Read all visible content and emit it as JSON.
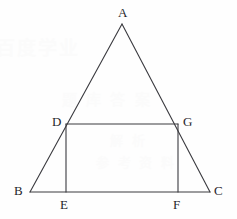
{
  "figure": {
    "kind": "geometry-diagram",
    "canvas": {
      "width": 237,
      "height": 219
    },
    "background_color": "#fefefe",
    "stroke_color": "#3a3a3f",
    "label_color": "#26262b",
    "stroke_width": 1.1,
    "points": {
      "A": {
        "label": "A",
        "x": 122,
        "y": 24,
        "label_x": 118,
        "label_y": 6
      },
      "B": {
        "label": "B",
        "x": 30,
        "y": 192,
        "label_x": 14,
        "label_y": 184
      },
      "C": {
        "label": "C",
        "x": 210,
        "y": 192,
        "label_x": 214,
        "label_y": 184
      },
      "D": {
        "label": "D",
        "x": 66,
        "y": 124,
        "label_x": 52,
        "label_y": 115
      },
      "E": {
        "label": "E",
        "x": 66,
        "y": 192,
        "label_x": 60,
        "label_y": 198
      },
      "F": {
        "label": "F",
        "x": 178,
        "y": 192,
        "label_x": 173,
        "label_y": 198
      },
      "G": {
        "label": "G",
        "x": 178,
        "y": 124,
        "label_x": 183,
        "label_y": 115
      }
    },
    "segments": [
      {
        "name": "side-AB",
        "from": "A",
        "to": "B"
      },
      {
        "name": "side-AC",
        "from": "A",
        "to": "C"
      },
      {
        "name": "base-BC",
        "from": "B",
        "to": "C"
      },
      {
        "name": "rect-top-DG",
        "from": "D",
        "to": "G"
      },
      {
        "name": "rect-left-DE",
        "from": "D",
        "to": "E"
      },
      {
        "name": "rect-right-GF",
        "from": "G",
        "to": "F"
      }
    ]
  },
  "watermarks": {
    "color": "#fbfbfb",
    "lines": [
      {
        "text": "百度学业"
      },
      {
        "text": "题 库 答 案"
      },
      {
        "text": "解 析"
      },
      {
        "text": "参 考 资 料"
      }
    ]
  }
}
